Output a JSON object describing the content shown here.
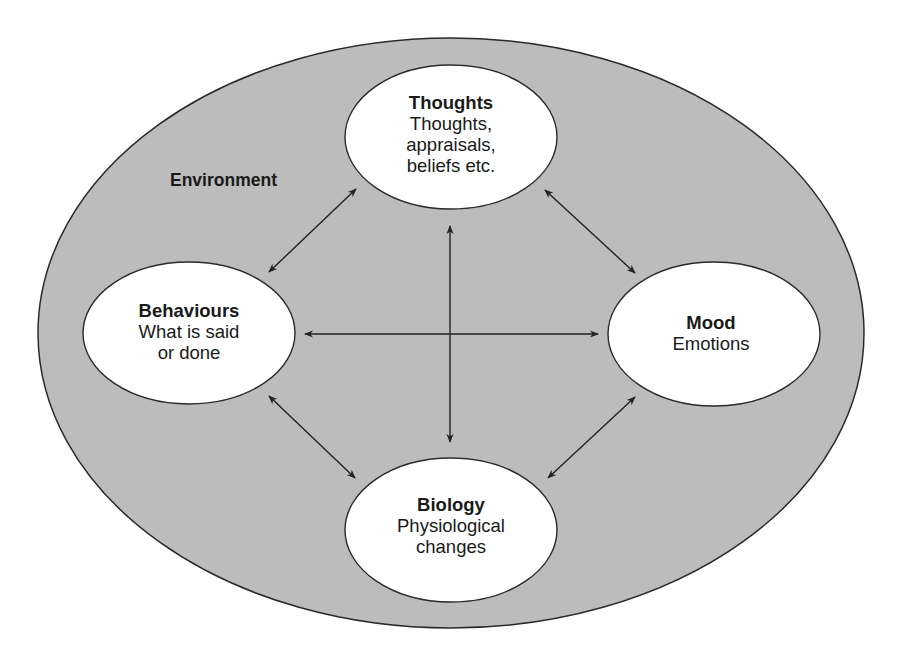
{
  "diagram": {
    "type": "cognitive-behavioural-model",
    "container": {
      "label": "Environment",
      "fill": "#bcbcbc",
      "stroke": "#2a2a2a"
    },
    "nodes": [
      {
        "id": "thoughts",
        "title": "Thoughts",
        "lines": [
          "Thoughts,",
          "appraisals,",
          "beliefs etc."
        ]
      },
      {
        "id": "behaviours",
        "title": "Behaviours",
        "lines": [
          "What is said",
          "or done"
        ]
      },
      {
        "id": "mood",
        "title": "Mood",
        "lines": [
          "Emotions"
        ]
      },
      {
        "id": "biology",
        "title": "Biology",
        "lines": [
          "Physiological",
          "changes"
        ]
      }
    ],
    "edges": [
      {
        "from": "thoughts",
        "to": "behaviours",
        "direction": "both"
      },
      {
        "from": "thoughts",
        "to": "mood",
        "direction": "both"
      },
      {
        "from": "thoughts",
        "to": "biology",
        "direction": "both"
      },
      {
        "from": "behaviours",
        "to": "mood",
        "direction": "both"
      },
      {
        "from": "behaviours",
        "to": "biology",
        "direction": "both"
      },
      {
        "from": "mood",
        "to": "biology",
        "direction": "both"
      }
    ],
    "node_fill": "#ffffff",
    "arrow_color": "#222222"
  }
}
